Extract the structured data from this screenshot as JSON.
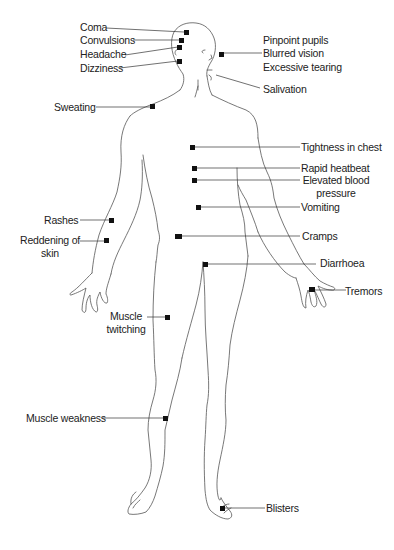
{
  "diagram": {
    "type": "anatomical-symptom-map",
    "colors": {
      "outline": "#555555",
      "leader": "#333333",
      "marker": "#111111",
      "text": "#222222"
    },
    "labels": {
      "coma": "Coma",
      "convulsions": "Convulsions",
      "headache": "Headache",
      "dizziness": "Dizziness",
      "sweating": "Sweating",
      "pinpoint_pupils": "Pinpoint pupils",
      "blurred_vision": "Blurred vision",
      "excessive_tearing": "Excessive tearing",
      "salivation": "Salivation",
      "tightness_in_chest": "Tightness in chest",
      "rapid_heartbeat": "Rapid heatbeat",
      "elevated_bp_1": "Elevated blood",
      "elevated_bp_2": "pressure",
      "vomiting": "Vomiting",
      "cramps": "Cramps",
      "diarrhoea": "Diarrhoea",
      "tremors": "Tremors",
      "rashes": "Rashes",
      "reddening_1": "Reddening of",
      "reddening_2": "skin",
      "muscle_twitching_1": "Muscle",
      "muscle_twitching_2": "twitching",
      "muscle_weakness": "Muscle weakness",
      "blisters": "Blisters"
    }
  }
}
